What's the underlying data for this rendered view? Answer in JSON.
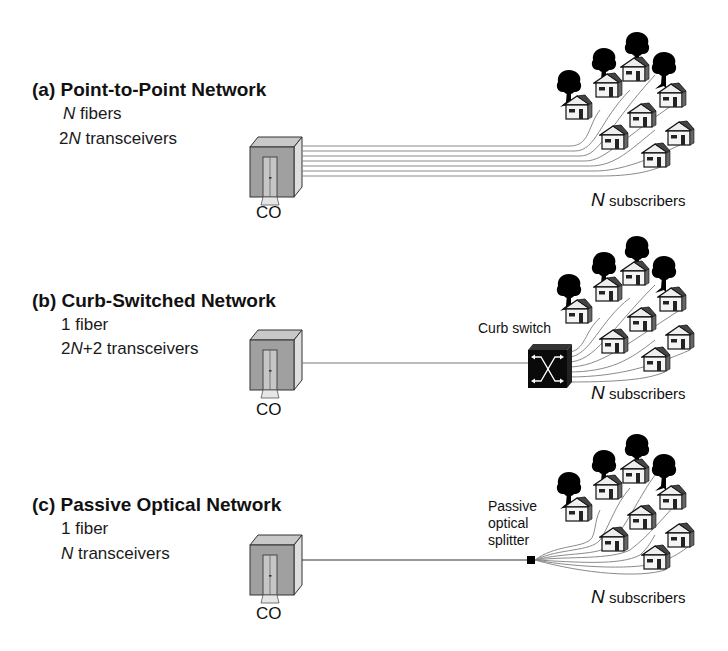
{
  "panels": [
    {
      "id": "a",
      "title": "(a) Point-to-Point Network",
      "line1_prefix": "",
      "line1_var": "N",
      "line1_suffix": " fibers",
      "line2_prefix": "2",
      "line2_var": "N",
      "line2_suffix": " transceivers",
      "co_label": "CO",
      "subscribers_var": "N",
      "subscribers_label": " subscribers",
      "fiber_count": 7
    },
    {
      "id": "b",
      "title": "(b) Curb-Switched Network",
      "line1_prefix": "1 fiber",
      "line1_var": "",
      "line1_suffix": "",
      "line2_prefix": "2",
      "line2_var": "N",
      "line2_suffix": "+2 transceivers",
      "co_label": "CO",
      "device_label": "Curb switch",
      "subscribers_var": "N",
      "subscribers_label": " subscribers",
      "fiber_count": 1
    },
    {
      "id": "c",
      "title": "(c) Passive Optical Network",
      "line1_prefix": "1 fiber",
      "line1_var": "",
      "line1_suffix": "",
      "line2_prefix": "",
      "line2_var": "N",
      "line2_suffix": " transceivers",
      "co_label": "CO",
      "device_label_lines": [
        "Passive",
        "optical",
        "splitter"
      ],
      "subscribers_var": "N",
      "subscribers_label": " subscribers",
      "fiber_count": 1
    }
  ],
  "colors": {
    "co_front": "#9a9a9a",
    "co_side": "#d8d8d8",
    "co_roof": "#c4c4c4",
    "fiber_line": "#8a8a8a",
    "feeder_line": "#555555",
    "tree": "#000000",
    "switch": "#0a0a0a"
  }
}
